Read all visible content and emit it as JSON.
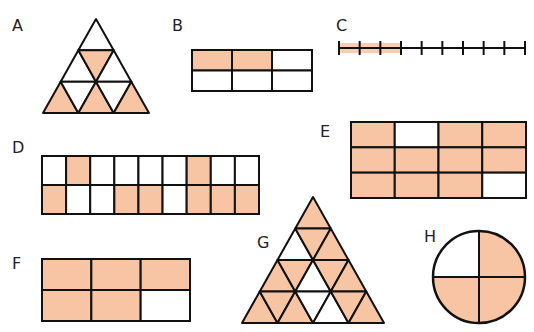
{
  "colors": {
    "fill": "#F7C4A4",
    "empty": "#FFFFFF",
    "stroke": "#111111"
  },
  "figures": {
    "A": {
      "label": "A",
      "type": "triangle-grid",
      "rows": 3,
      "cells": [
        [
          "W"
        ],
        [
          "W",
          "S",
          "W"
        ],
        [
          "S",
          "W",
          "S",
          "W",
          "S"
        ]
      ],
      "shaded": 4,
      "total": 9
    },
    "B": {
      "label": "B",
      "type": "rect-grid",
      "cols": 3,
      "rows": 2,
      "cells": [
        [
          "S",
          "S",
          "W"
        ],
        [
          "W",
          "W",
          "W"
        ]
      ],
      "shaded": 2,
      "total": 6
    },
    "C": {
      "label": "C",
      "type": "number-line",
      "segments": 9,
      "shaded_segments": 3
    },
    "D": {
      "label": "D",
      "type": "rect-grid",
      "cols": 9,
      "rows": 2,
      "cells": [
        [
          "W",
          "S",
          "W",
          "W",
          "W",
          "W",
          "S",
          "W",
          "W"
        ],
        [
          "S",
          "W",
          "W",
          "S",
          "S",
          "W",
          "S",
          "S",
          "S"
        ]
      ],
      "shaded": 8,
      "total": 18
    },
    "E": {
      "label": "E",
      "type": "rect-grid",
      "cols": 4,
      "rows": 3,
      "cells": [
        [
          "S",
          "W",
          "S",
          "S"
        ],
        [
          "S",
          "S",
          "S",
          "S"
        ],
        [
          "S",
          "S",
          "S",
          "W"
        ]
      ],
      "shaded": 10,
      "total": 12
    },
    "F": {
      "label": "F",
      "type": "rect-grid",
      "cols": 3,
      "rows": 2,
      "cells": [
        [
          "S",
          "S",
          "S"
        ],
        [
          "S",
          "S",
          "W"
        ]
      ],
      "shaded": 5,
      "total": 6
    },
    "G": {
      "label": "G",
      "type": "triangle-grid",
      "rows": 4,
      "cells": [
        [
          "S"
        ],
        [
          "W",
          "S",
          "S"
        ],
        [
          "S",
          "S",
          "W",
          "S",
          "S"
        ],
        [
          "S",
          "S",
          "S",
          "W",
          "W",
          "S",
          "S"
        ]
      ],
      "shaded": 12,
      "total": 16
    },
    "H": {
      "label": "H",
      "type": "circle-quarters",
      "cells": [
        "W",
        "S",
        "S",
        "S"
      ],
      "shaded": 3,
      "total": 4
    }
  }
}
